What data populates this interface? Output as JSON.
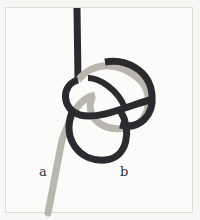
{
  "figure": {
    "labels": {
      "a": "a",
      "b": "b"
    },
    "colors": {
      "dark_rope": "#2c2a2e",
      "light_rope": "#b9b6b0",
      "background": "#fbfbf9"
    }
  }
}
